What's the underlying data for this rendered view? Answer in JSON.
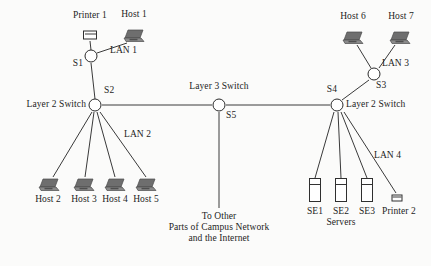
{
  "diagram": {
    "colors": {
      "line": "#3a3a3a",
      "node_stroke": "#2a2a2a",
      "icon_fill": "#6e6e6e",
      "background": "#fbfbfa",
      "text": "#1d1d1d"
    },
    "nodes": [
      {
        "id": "S1",
        "label": "S1",
        "type": "layer-2-switch",
        "x": 91,
        "y": 56
      },
      {
        "id": "S2",
        "label": "S2",
        "type": "layer-2-switch",
        "x": 95,
        "y": 105
      },
      {
        "id": "S3",
        "label": "S3",
        "type": "layer-2-switch",
        "x": 374,
        "y": 74
      },
      {
        "id": "S4",
        "label": "S4",
        "type": "layer-2-switch",
        "x": 337,
        "y": 105
      },
      {
        "id": "S5",
        "label": "S5",
        "type": "layer-3-switch",
        "x": 219,
        "y": 105
      }
    ],
    "switch_role_labels": [
      {
        "text": "Layer 2 Switch",
        "for": "S2",
        "x": 88,
        "y": 99,
        "align": "right"
      },
      {
        "text": "Layer 3 Switch",
        "for": "S5",
        "x": 219,
        "y": 85,
        "align": "center"
      },
      {
        "text": "Layer 2 Switch",
        "for": "S4",
        "x": 344,
        "y": 99,
        "align": "left"
      }
    ],
    "lan_labels": [
      {
        "text": "LAN 1",
        "x": 113,
        "y": 50
      },
      {
        "text": "LAN 2",
        "x": 133,
        "y": 121
      },
      {
        "text": "LAN 3",
        "x": 390,
        "y": 60
      },
      {
        "text": "LAN 4",
        "x": 379,
        "y": 146
      }
    ],
    "hosts": [
      {
        "id": "Host1",
        "label": "Host 1",
        "x": 134,
        "y": 36,
        "label_x": 134,
        "label_y": 14
      },
      {
        "id": "Host2",
        "label": "Host 2",
        "x": 49,
        "y": 185,
        "label_x": 47,
        "label_y": 194
      },
      {
        "id": "Host3",
        "label": "Host 3",
        "x": 84,
        "y": 185,
        "label_x": 83,
        "label_y": 194
      },
      {
        "id": "Host4",
        "label": "Host 4",
        "x": 115,
        "y": 185,
        "label_x": 114,
        "label_y": 194
      },
      {
        "id": "Host5",
        "label": "Host 5",
        "x": 146,
        "y": 185,
        "label_x": 145,
        "label_y": 194
      },
      {
        "id": "Host6",
        "label": "Host 6",
        "x": 353,
        "y": 38,
        "label_x": 352,
        "label_y": 16
      },
      {
        "id": "Host7",
        "label": "Host 7",
        "x": 400,
        "y": 38,
        "label_x": 400,
        "label_y": 16
      }
    ],
    "printers": [
      {
        "id": "Printer1",
        "label": "Printer 1",
        "x": 90,
        "y": 35,
        "label_x": 90,
        "label_y": 15,
        "size": "large"
      },
      {
        "id": "Printer2",
        "label": "Printer 2",
        "x": 397,
        "y": 198,
        "label_x": 398,
        "label_y": 207,
        "size": "small"
      }
    ],
    "servers": [
      {
        "id": "SE1",
        "label": "SE1",
        "x": 315,
        "y": 190,
        "label_x": 315,
        "label_y": 206
      },
      {
        "id": "SE2",
        "label": "SE2",
        "x": 341,
        "y": 190,
        "label_x": 341,
        "label_y": 206
      },
      {
        "id": "SE3",
        "label": "SE3",
        "x": 367,
        "y": 190,
        "label_x": 367,
        "label_y": 206
      }
    ],
    "group_labels": [
      {
        "text": "Servers",
        "x": 341,
        "y": 217
      }
    ],
    "uplink_note": {
      "line1": "To Other",
      "line2": "Parts of Campus Network",
      "line3": "and the Internet",
      "x": 219,
      "y": 219
    },
    "links": [
      {
        "from": "Printer1",
        "to": "S1",
        "x1": 90,
        "y1": 41,
        "x2": 91,
        "y2": 50
      },
      {
        "from": "Host1",
        "to": "S1",
        "x1": 127,
        "y1": 43,
        "x2": 97,
        "y2": 53
      },
      {
        "from": "S1",
        "to": "S2",
        "x1": 91,
        "y1": 63,
        "x2": 95,
        "y2": 99
      },
      {
        "from": "S2",
        "to": "S5",
        "x1": 102,
        "y1": 105,
        "x2": 212,
        "y2": 105
      },
      {
        "from": "S5",
        "to": "S4",
        "x1": 226,
        "y1": 105,
        "x2": 330,
        "y2": 105
      },
      {
        "from": "S5",
        "to": "Internet",
        "x1": 219,
        "y1": 112,
        "x2": 219,
        "y2": 208
      },
      {
        "from": "S2",
        "to": "Host2",
        "x1": 92,
        "y1": 112,
        "x2": 53,
        "y2": 177
      },
      {
        "from": "S2",
        "to": "Host3",
        "x1": 94,
        "y1": 112,
        "x2": 85,
        "y2": 177
      },
      {
        "from": "S2",
        "to": "Host4",
        "x1": 97,
        "y1": 112,
        "x2": 115,
        "y2": 177
      },
      {
        "from": "S2",
        "to": "Host5",
        "x1": 100,
        "y1": 112,
        "x2": 146,
        "y2": 177
      },
      {
        "from": "Host6",
        "to": "S3",
        "x1": 357,
        "y1": 45,
        "x2": 371,
        "y2": 68
      },
      {
        "from": "Host7",
        "to": "S3",
        "x1": 395,
        "y1": 45,
        "x2": 379,
        "y2": 68
      },
      {
        "from": "S3",
        "to": "S4",
        "x1": 369,
        "y1": 80,
        "x2": 342,
        "y2": 100
      },
      {
        "from": "S4",
        "to": "SE1",
        "x1": 334,
        "y1": 112,
        "x2": 315,
        "y2": 178
      },
      {
        "from": "S4",
        "to": "SE2",
        "x1": 338,
        "y1": 112,
        "x2": 341,
        "y2": 178
      },
      {
        "from": "S4",
        "to": "SE3",
        "x1": 341,
        "y1": 112,
        "x2": 367,
        "y2": 178
      },
      {
        "from": "S4",
        "to": "Printer2",
        "x1": 344,
        "y1": 112,
        "x2": 396,
        "y2": 193
      }
    ]
  }
}
